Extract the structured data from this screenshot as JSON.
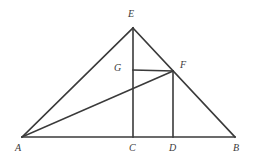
{
  "figure": {
    "type": "geometry-diagram",
    "background_color": "#ffffff",
    "stroke_color": "#3a3a3a",
    "stroke_width": 1.6,
    "canvas": {
      "width": 257,
      "height": 163
    },
    "points": {
      "A": {
        "label": "A",
        "x": 22,
        "y": 137,
        "label_x": 15,
        "label_y": 143
      },
      "B": {
        "label": "B",
        "x": 235,
        "y": 137,
        "label_x": 233,
        "label_y": 143
      },
      "C": {
        "label": "C",
        "x": 133,
        "y": 137,
        "label_x": 129,
        "label_y": 143
      },
      "D": {
        "label": "D",
        "x": 173,
        "y": 137,
        "label_x": 169,
        "label_y": 143
      },
      "E": {
        "label": "E",
        "x": 133,
        "y": 28,
        "label_x": 128,
        "label_y": 9
      },
      "F": {
        "label": "F",
        "x": 173,
        "y": 71,
        "label_x": 180,
        "label_y": 60
      },
      "G": {
        "label": "G",
        "x": 133,
        "y": 70,
        "label_x": 114,
        "label_y": 63
      }
    },
    "segments": [
      {
        "name": "side-AE",
        "from": "A",
        "to": "E"
      },
      {
        "name": "side-EB",
        "from": "E",
        "to": "B"
      },
      {
        "name": "base-AB",
        "from": "A",
        "to": "B"
      },
      {
        "name": "altitude-EC",
        "from": "E",
        "to": "C"
      },
      {
        "name": "perpendicular-FD",
        "from": "F",
        "to": "D"
      },
      {
        "name": "horizontal-GF",
        "from": "G",
        "to": "F"
      },
      {
        "name": "cevian-AF",
        "from": "A",
        "to": "F"
      }
    ]
  }
}
